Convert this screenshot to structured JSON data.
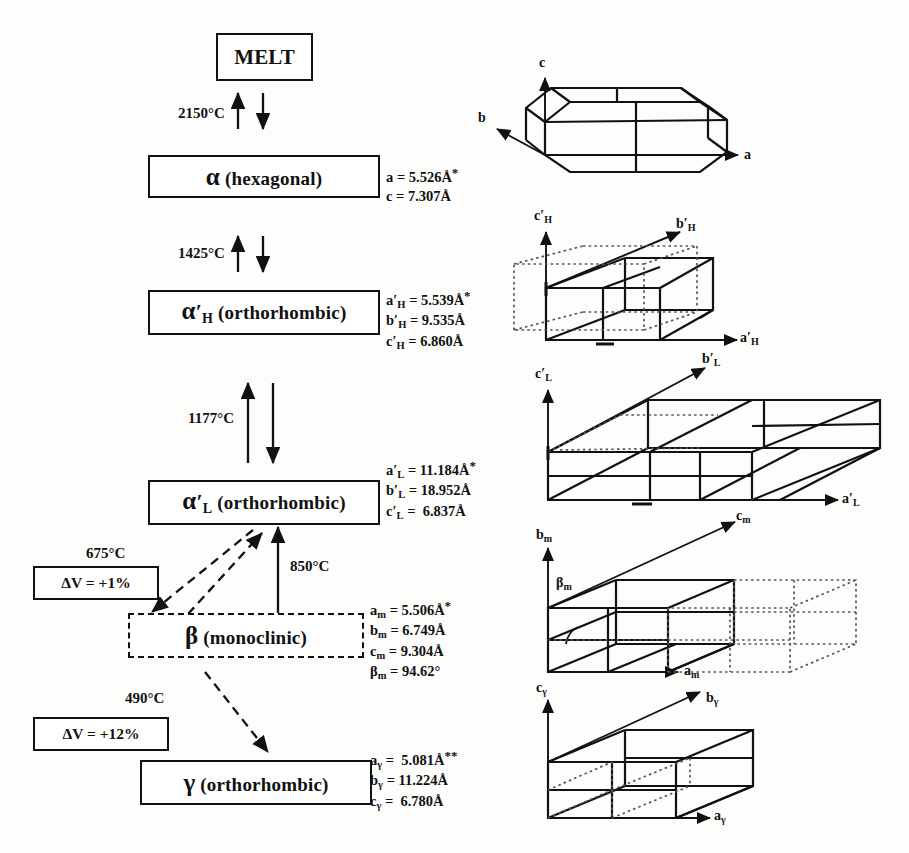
{
  "diagram": {
    "colors": {
      "line": "#111111",
      "background": "#fdfdfc",
      "dotted": "#555555"
    }
  },
  "phases": [
    {
      "id": "melt",
      "label": "MELT",
      "greek": "",
      "sub": "",
      "prime": false,
      "suffix": "",
      "border": "solid"
    },
    {
      "id": "alpha",
      "label": "α (hexagonal)",
      "greek": "α",
      "sub": "",
      "prime": false,
      "suffix": "(hexagonal)",
      "border": "solid"
    },
    {
      "id": "alphaH",
      "label": "α'H (orthorhombic)",
      "greek": "α",
      "sub": "H",
      "prime": true,
      "suffix": "(orthorhombic)",
      "border": "solid"
    },
    {
      "id": "alphaL",
      "label": "α'L (orthorhombic)",
      "greek": "α",
      "sub": "L",
      "prime": true,
      "suffix": "(orthorhombic)",
      "border": "solid"
    },
    {
      "id": "beta",
      "label": "β (monoclinic)",
      "greek": "β",
      "sub": "",
      "prime": false,
      "suffix": "(monoclinic)",
      "border": "dashed"
    },
    {
      "id": "gamma",
      "label": "γ (orthorhombic)",
      "greek": "γ",
      "sub": "",
      "prime": false,
      "suffix": "(orthorhombic)",
      "border": "solid"
    }
  ],
  "transitions": [
    {
      "id": "melt-alpha",
      "temperature": "2150°C",
      "style": "solid"
    },
    {
      "id": "alpha-alphaH",
      "temperature": "1425°C",
      "style": "solid"
    },
    {
      "id": "alphaH-alphaL",
      "temperature": "1177°C",
      "style": "solid"
    },
    {
      "id": "alphaL-beta",
      "temperature": "675°C",
      "style": "dashed"
    },
    {
      "id": "beta-alphaL",
      "temperature": "850°C",
      "style": "solid"
    },
    {
      "id": "beta-gamma",
      "temperature": "490°C",
      "style": "dashed"
    }
  ],
  "volume_changes": [
    {
      "id": "dv-beta",
      "label": "ΔV = +1%"
    },
    {
      "id": "dv-gamma",
      "label": "ΔV = +12%"
    }
  ],
  "lattice_parameters": [
    {
      "phase": "alpha",
      "rows": [
        {
          "symbol": "a",
          "sub": "",
          "prime": false,
          "value": "= 5.526Å",
          "note": "*"
        },
        {
          "symbol": "c",
          "sub": "",
          "prime": false,
          "value": "= 7.307Å",
          "note": ""
        }
      ]
    },
    {
      "phase": "alphaH",
      "rows": [
        {
          "symbol": "a",
          "sub": "H",
          "prime": true,
          "value": "= 5.539Å",
          "note": "*"
        },
        {
          "symbol": "b",
          "sub": "H",
          "prime": true,
          "value": "= 9.535Å",
          "note": ""
        },
        {
          "symbol": "c",
          "sub": "H",
          "prime": true,
          "value": "= 6.860Å",
          "note": ""
        }
      ]
    },
    {
      "phase": "alphaL",
      "rows": [
        {
          "symbol": "a",
          "sub": "L",
          "prime": true,
          "value": "= 11.184Å",
          "note": "*"
        },
        {
          "symbol": "b",
          "sub": "L",
          "prime": true,
          "value": "= 18.952Å",
          "note": ""
        },
        {
          "symbol": "c",
          "sub": "L",
          "prime": true,
          "value": "=  6.837Å",
          "note": ""
        }
      ]
    },
    {
      "phase": "beta",
      "rows": [
        {
          "symbol": "a",
          "sub": "m",
          "prime": false,
          "value": "= 5.506Å",
          "note": "*"
        },
        {
          "symbol": "b",
          "sub": "m",
          "prime": false,
          "value": "= 6.749Å",
          "note": ""
        },
        {
          "symbol": "c",
          "sub": "m",
          "prime": false,
          "value": "= 9.304Å",
          "note": ""
        },
        {
          "symbol": "β",
          "sub": "m",
          "prime": false,
          "value": "= 94.62°",
          "note": ""
        }
      ]
    },
    {
      "phase": "gamma",
      "rows": [
        {
          "symbol": "a",
          "sub": "γ",
          "prime": false,
          "value": "=  5.081Å",
          "note": "**"
        },
        {
          "symbol": "b",
          "sub": "γ",
          "prime": false,
          "value": "= 11.224Å",
          "note": ""
        },
        {
          "symbol": "c",
          "sub": "γ",
          "prime": false,
          "value": "=  6.780Å",
          "note": ""
        }
      ]
    }
  ],
  "unit_cells": [
    {
      "id": "cell-alpha",
      "phase": "alpha",
      "axes": [
        {
          "name": "c",
          "sub": "",
          "direction": "up"
        },
        {
          "name": "b",
          "sub": "",
          "direction": "diagonal"
        },
        {
          "name": "a",
          "sub": "",
          "direction": "right"
        }
      ],
      "has_reference_cell": false,
      "angle_marker": ""
    },
    {
      "id": "cell-alphaH",
      "phase": "alphaH",
      "axes": [
        {
          "name": "c",
          "sub": "H",
          "direction": "up"
        },
        {
          "name": "b",
          "sub": "H",
          "direction": "diagonal"
        },
        {
          "name": "a",
          "sub": "H",
          "direction": "right"
        }
      ],
      "has_reference_cell": true,
      "angle_marker": ""
    },
    {
      "id": "cell-alphaL",
      "phase": "alphaL",
      "axes": [
        {
          "name": "c",
          "sub": "L",
          "direction": "up"
        },
        {
          "name": "b",
          "sub": "L",
          "direction": "diagonal"
        },
        {
          "name": "a",
          "sub": "L",
          "direction": "right"
        }
      ],
      "has_reference_cell": true,
      "angle_marker": ""
    },
    {
      "id": "cell-beta",
      "phase": "beta",
      "axes": [
        {
          "name": "b",
          "sub": "m",
          "direction": "up"
        },
        {
          "name": "c",
          "sub": "m",
          "direction": "diagonal"
        },
        {
          "name": "a",
          "sub": "m",
          "direction": "right"
        }
      ],
      "has_reference_cell": true,
      "angle_marker": "β"
    },
    {
      "id": "cell-gamma",
      "phase": "gamma",
      "axes": [
        {
          "name": "c",
          "sub": "γ",
          "direction": "up"
        },
        {
          "name": "b",
          "sub": "γ",
          "direction": "diagonal"
        },
        {
          "name": "a",
          "sub": "γ",
          "direction": "right"
        }
      ],
      "has_reference_cell": true,
      "angle_marker": ""
    }
  ]
}
